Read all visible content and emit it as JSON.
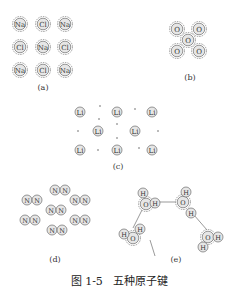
{
  "figure": {
    "caption_number": "图 1-5",
    "caption_title": "五种原子键",
    "panels": [
      {
        "id": "a",
        "label": "(a)",
        "bond": "ionic",
        "atoms": [
          [
            "Na",
            "Cl",
            "Na"
          ],
          [
            "Cl",
            "Na",
            "Cl"
          ],
          [
            "Na",
            "Cl",
            "Na"
          ]
        ]
      },
      {
        "id": "b",
        "label": "(b)",
        "bond": "covalent",
        "atoms": [
          "O",
          "O",
          "O",
          "O",
          "O"
        ]
      },
      {
        "id": "c",
        "label": "(c)",
        "bond": "metallic",
        "atoms": [
          [
            "Li",
            "Li",
            "Li"
          ],
          [
            "Li",
            "Li"
          ],
          [
            "Li",
            "Li",
            "Li"
          ]
        ]
      },
      {
        "id": "d",
        "label": "(d)",
        "bond": "van-der-waals",
        "atom": "N"
      },
      {
        "id": "e",
        "label": "(e)",
        "bond": "hydrogen",
        "atoms": [
          "O",
          "H"
        ]
      }
    ]
  },
  "colors": {
    "atom_fill": "#e6e6e6",
    "stroke": "#555555",
    "text": "#333333"
  }
}
